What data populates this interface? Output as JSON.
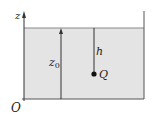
{
  "diagram": {
    "labels": {
      "axis_z": "z",
      "origin": "O",
      "depth": "h",
      "height": "z",
      "height_sub": "0",
      "point": "Q"
    },
    "colors": {
      "water": "#e4e4e4",
      "line": "#444444",
      "surface": "#888888"
    }
  }
}
